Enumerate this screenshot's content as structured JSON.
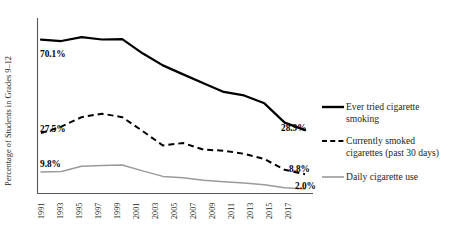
{
  "chart_data": {
    "type": "line",
    "title": "",
    "xlabel": "",
    "ylabel": "Percentage of Students in Grades 9–12",
    "ylim": [
      0,
      80
    ],
    "xlim": [
      1991,
      2017
    ],
    "grid": false,
    "legend_position": "right",
    "categories": [
      1991,
      1993,
      1995,
      1997,
      1999,
      2001,
      2003,
      2005,
      2007,
      2009,
      2011,
      2013,
      2015,
      2017
    ],
    "tick_labels": [
      "1991",
      "1993",
      "1995",
      "1997",
      "1999",
      "2001",
      "2003",
      "2005",
      "2007",
      "2009",
      "2011",
      "2013",
      "2015",
      "2017"
    ],
    "series": [
      {
        "name": "Ever tried cigarette smoking",
        "style": "solid-black-thick",
        "color": "#000000",
        "values": [
          70.1,
          69.5,
          71.3,
          70.2,
          70.4,
          63.9,
          58.4,
          54.3,
          50.3,
          46.3,
          44.7,
          41.1,
          32.3,
          28.9
        ],
        "start_label": "70.1%",
        "end_label": "28.9%"
      },
      {
        "name": "Currently smoked cigarettes (past 30 days)",
        "style": "dashed-black",
        "color": "#000000",
        "values": [
          27.5,
          30.5,
          34.8,
          36.4,
          34.8,
          28.5,
          21.9,
          23.0,
          20.0,
          19.5,
          18.1,
          15.7,
          10.8,
          8.8
        ],
        "start_label": "27.5%",
        "end_label": "8.8%"
      },
      {
        "name": "Daily cigarette use",
        "style": "solid-gray-thin",
        "color": "#9a9a9a",
        "values": [
          9.8,
          10.0,
          12.4,
          12.8,
          13.0,
          10.3,
          7.8,
          7.2,
          6.0,
          5.4,
          4.8,
          4.0,
          2.6,
          2.0
        ],
        "start_label": "9.8%",
        "end_label": "2.0%"
      }
    ],
    "point_labels": [
      {
        "name": "ever-start",
        "text": "70.1%",
        "x": 40,
        "y": 57
      },
      {
        "name": "ever-end",
        "text": "28.9%",
        "x": 281,
        "y": 131
      },
      {
        "name": "current-start",
        "text": "27.5%",
        "x": 40,
        "y": 132
      },
      {
        "name": "current-end",
        "text": "8.8%",
        "x": 289,
        "y": 172
      },
      {
        "name": "daily-start",
        "text": "9.8%",
        "x": 40,
        "y": 167
      },
      {
        "name": "daily-end",
        "text": "2.0%",
        "x": 295,
        "y": 189
      }
    ],
    "legend_entries": [
      {
        "name": "Ever tried cigarette",
        "line2": "smoking",
        "style": "solid-black-thick"
      },
      {
        "name": "Currently smoked",
        "line2": "cigarettes (past 30 days)",
        "style": "dashed-black"
      },
      {
        "name": "Daily cigarette use",
        "line2": "",
        "style": "solid-gray-thin"
      }
    ]
  },
  "axis": {
    "y_title": "Percentage of Students in Grades 9–12"
  }
}
